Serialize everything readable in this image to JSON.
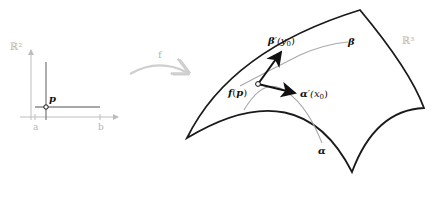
{
  "figure": {
    "domain_left": {
      "space_label": "ℝ²",
      "point_label": "p",
      "tick_a": "a",
      "tick_b": "b"
    },
    "map": {
      "label": "f"
    },
    "surface": {
      "space_label": "ℝ³",
      "point_label_f": "f",
      "point_label_open": "(",
      "point_label_p": "p",
      "point_label_close": ")",
      "curve_beta": "β",
      "curve_alpha": "α",
      "vector_beta": "β",
      "vector_beta_arg": "′(y",
      "vector_beta_sub": "0",
      "vector_beta_close": ")",
      "vector_alpha": "α",
      "vector_alpha_arg": "′(x",
      "vector_alpha_sub": "0",
      "vector_alpha_close": ")"
    },
    "colors": {
      "outline": "#1a1a1a",
      "curve_gray": "#a8a8a8",
      "axis_gray": "#bdbdbd",
      "map_arrow": "#cfcfcf",
      "line_gray": "#8a8a8a"
    }
  }
}
